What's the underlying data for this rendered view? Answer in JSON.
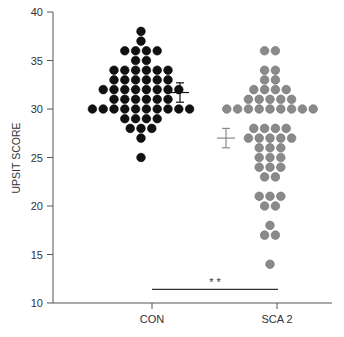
{
  "chart_data": {
    "type": "scatter",
    "subtype": "dot-plot",
    "title": "",
    "xlabel": "",
    "ylabel": "UPSIT SCORE",
    "ylim": [
      10,
      40
    ],
    "yticks": [
      10,
      15,
      20,
      25,
      30,
      35,
      40
    ],
    "categories": [
      "CON",
      "SCA 2"
    ],
    "grid": false,
    "series": [
      {
        "name": "CON",
        "color": "#111111",
        "points": [
          {
            "y": 38,
            "n": 1
          },
          {
            "y": 37,
            "n": 1
          },
          {
            "y": 36,
            "n": 4
          },
          {
            "y": 35,
            "n": 2
          },
          {
            "y": 34,
            "n": 6
          },
          {
            "y": 33,
            "n": 6
          },
          {
            "y": 32,
            "n": 8
          },
          {
            "y": 31,
            "n": 6
          },
          {
            "y": 30,
            "n": 10
          },
          {
            "y": 29,
            "n": 4
          },
          {
            "y": 28,
            "n": 3
          },
          {
            "y": 27,
            "n": 1
          },
          {
            "y": 25,
            "n": 1
          }
        ],
        "mean": 31.7,
        "error": 1.0,
        "error_color": "#111111"
      },
      {
        "name": "SCA 2",
        "color": "#8a8a8a",
        "points": [
          {
            "y": 36,
            "n": 2
          },
          {
            "y": 34,
            "n": 2
          },
          {
            "y": 33,
            "n": 2
          },
          {
            "y": 32,
            "n": 4
          },
          {
            "y": 31,
            "n": 5
          },
          {
            "y": 30,
            "n": 9
          },
          {
            "y": 28,
            "n": 4
          },
          {
            "y": 27,
            "n": 5
          },
          {
            "y": 26,
            "n": 3
          },
          {
            "y": 25,
            "n": 3
          },
          {
            "y": 24,
            "n": 3
          },
          {
            "y": 23,
            "n": 2
          },
          {
            "y": 21,
            "n": 3
          },
          {
            "y": 20,
            "n": 2
          },
          {
            "y": 18,
            "n": 1
          },
          {
            "y": 17,
            "n": 2
          },
          {
            "y": 14,
            "n": 1
          }
        ],
        "mean": 27.0,
        "error": 1.0,
        "error_color": "#8a8a8a"
      }
    ],
    "annotations": [
      {
        "text": "* *",
        "type": "significance",
        "between": [
          "CON",
          "SCA 2"
        ],
        "y": 11.4
      }
    ]
  }
}
